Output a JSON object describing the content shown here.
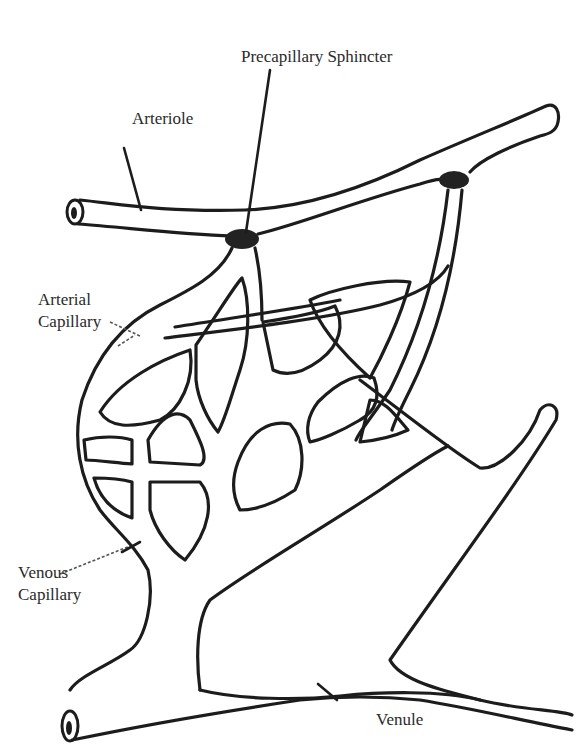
{
  "diagram": {
    "labels": {
      "precapillary_sphincter": "Precapillary Sphincter",
      "arteriole": "Arteriole",
      "arterial_capillary_line1": "Arterial",
      "arterial_capillary_line2": "Capillary",
      "venous_capillary_line1": "Venous",
      "venous_capillary_line2": "Capillary",
      "venule": "Venule"
    },
    "structures": [
      "arteriole",
      "precapillary-sphincter-left",
      "precapillary-sphincter-right",
      "capillary-network",
      "metarteriole-thoroughfare",
      "venule"
    ],
    "colors": {
      "stroke": "#1c1c1c",
      "sphincter_fill": "#222222",
      "background": "#ffffff",
      "text": "#2a2a2a"
    }
  }
}
